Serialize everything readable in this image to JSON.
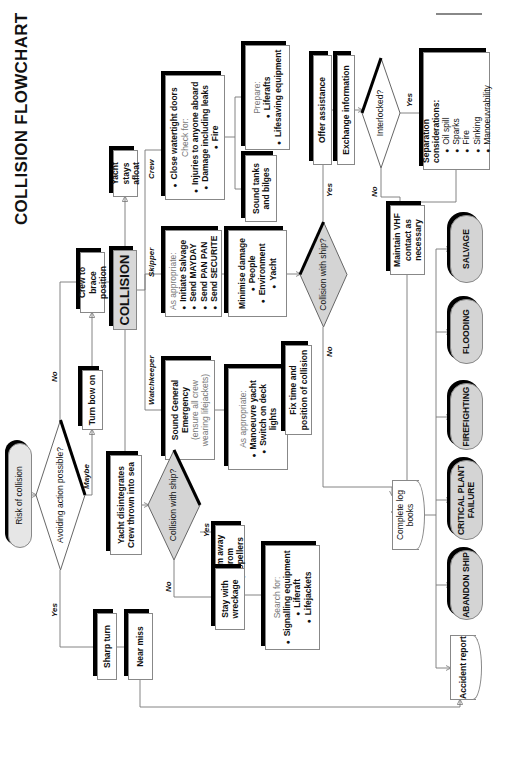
{
  "title": "COLLISION FLOWCHART",
  "nodes": {
    "risk": "Risk of collision",
    "avoiding": "Avoiding action possible?",
    "turn_bow": "Turn bow on",
    "crew_brace": "Crew to brace position",
    "collision": "COLLISION",
    "yacht_afloat": "Yacht stays afloat",
    "crew_box": {
      "line1": "Close watertight doors",
      "check_for": "Check for:",
      "items": [
        "Injuries to anyone aboard",
        "Damage including leaks",
        "Fire"
      ]
    },
    "sound_tanks": "Sound tanks and bilges",
    "prepare": {
      "heading": "Prepare:",
      "items": [
        "Liferafts",
        "Lifesaving equipment"
      ]
    },
    "skipper_box": {
      "heading": "As appropriate:",
      "items": [
        "Initiate Salvage",
        "Send MAYDAY",
        "Send PAN PAN",
        "Send SECURITE"
      ]
    },
    "minimise": {
      "heading": "Minimise damage",
      "items": [
        "People",
        "Environment",
        "Yacht"
      ]
    },
    "collision_ship_right": "Collision with ship?",
    "offer_assistance": "Offer assistance",
    "exchange_info": "Exchange information",
    "interlocked": "Interlocked?",
    "separation": {
      "heading": "Separation considerations:",
      "items": [
        "Oil spill",
        "Sparks",
        "Fire",
        "Sinking",
        "Manoeuvrability"
      ]
    },
    "maintain_vhf": "Maintain VHF contact as necessary",
    "watchkeeper_box": {
      "line1": "Sound General Emergency",
      "note": "(ensure all crew wearing lifejackets)"
    },
    "watch_appropriate": {
      "heading": "As appropriate:",
      "items": [
        "Manoeuvre yacht",
        "Switch on deck lights"
      ]
    },
    "fix_time": "Fix time and position of collision",
    "yacht_disintegrates": "Yacht disintegrates Crew thrown into sea",
    "collision_ship_left": "Collision with ship?",
    "swim_away": "Swim away from propellers",
    "stay_wreckage": "Stay with wreckage",
    "search_for": {
      "heading": "Search for:",
      "items": [
        "Signalling equipment",
        "Liferaft",
        "Lifejackets"
      ]
    },
    "sharp_turn": "Sharp turn",
    "near_miss": "Near miss",
    "log_books": "Complete log books",
    "accident_report": "Accident report",
    "salvage": "SALVAGE",
    "flooding": "FLOODING",
    "firefighting": "FIREFIGHTING",
    "critical_plant": "CRITICAL PLANT FAILURE",
    "abandon_ship": "ABANDON SHIP"
  },
  "edge_labels": {
    "no_top": "No",
    "maybe": "Maybe",
    "yes_left": "Yes",
    "crew": "Crew",
    "skipper": "Skipper",
    "watchkeeper": "Watchkeeper",
    "yes_right": "Yes",
    "no_right": "No",
    "yes_interlocked": "Yes",
    "no_interlocked": "No",
    "yes_swim": "Yes",
    "no_wreck": "No"
  }
}
